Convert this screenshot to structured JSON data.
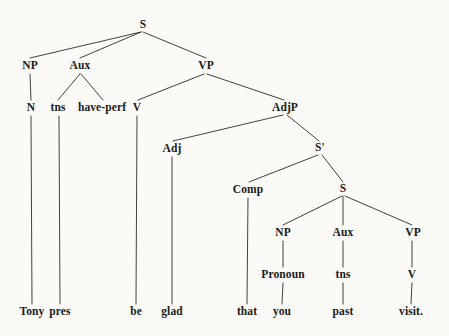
{
  "figure": {
    "kind": "syntax-tree",
    "sentence": "Tony pres be glad that you past visit.",
    "background_color": "#fbfaf7",
    "line_color": "#2b2b2b",
    "text_color": "#1a1a1a"
  },
  "nodes": [
    {
      "id": "s-root",
      "label": "S",
      "x": 143,
      "y": 25
    },
    {
      "id": "np-matrix",
      "label": "NP",
      "x": 30,
      "y": 66
    },
    {
      "id": "aux-matrix",
      "label": "Aux",
      "x": 80,
      "y": 66
    },
    {
      "id": "vp-matrix",
      "label": "VP",
      "x": 206,
      "y": 66
    },
    {
      "id": "n-matrix",
      "label": "N",
      "x": 31,
      "y": 108
    },
    {
      "id": "tns-matrix",
      "label": "tns",
      "x": 58,
      "y": 108
    },
    {
      "id": "have-perf",
      "label": "have-perf",
      "x": 102,
      "y": 108
    },
    {
      "id": "v-matrix",
      "label": "V",
      "x": 137,
      "y": 108
    },
    {
      "id": "adjp",
      "label": "AdjP",
      "x": 285,
      "y": 108
    },
    {
      "id": "adj",
      "label": "Adj",
      "x": 172,
      "y": 149
    },
    {
      "id": "s-bar",
      "label": "S'",
      "x": 320,
      "y": 148
    },
    {
      "id": "comp",
      "label": "Comp",
      "x": 248,
      "y": 190
    },
    {
      "id": "s-embedded",
      "label": "S",
      "x": 343,
      "y": 189
    },
    {
      "id": "np-embedded",
      "label": "NP",
      "x": 283,
      "y": 233
    },
    {
      "id": "aux-embedded",
      "label": "Aux",
      "x": 343,
      "y": 233
    },
    {
      "id": "vp-embedded",
      "label": "VP",
      "x": 413,
      "y": 233
    },
    {
      "id": "pronoun",
      "label": "Pronoun",
      "x": 283,
      "y": 275
    },
    {
      "id": "tns-embedded",
      "label": "tns",
      "x": 343,
      "y": 275
    },
    {
      "id": "v-embedded",
      "label": "V",
      "x": 412,
      "y": 275
    }
  ],
  "terminals": [
    {
      "id": "word-tony",
      "label": "Tony",
      "x": 32,
      "y": 312
    },
    {
      "id": "word-pres",
      "label": "pres",
      "x": 60,
      "y": 312
    },
    {
      "id": "word-be",
      "label": "be",
      "x": 136,
      "y": 312
    },
    {
      "id": "word-glad",
      "label": "glad",
      "x": 172,
      "y": 312
    },
    {
      "id": "word-that",
      "label": "that",
      "x": 247,
      "y": 312
    },
    {
      "id": "word-you",
      "label": "you",
      "x": 282,
      "y": 312
    },
    {
      "id": "word-past",
      "label": "past",
      "x": 343,
      "y": 312
    },
    {
      "id": "word-visit",
      "label": "visit.",
      "x": 411,
      "y": 312
    }
  ],
  "edges": [
    {
      "id": "e-s-np",
      "from": "s-root",
      "to": "np-matrix",
      "x1": 141,
      "y1": 32,
      "x2": 30,
      "y2": 58
    },
    {
      "id": "e-s-aux",
      "from": "s-root",
      "to": "aux-matrix",
      "x1": 141,
      "y1": 32,
      "x2": 80,
      "y2": 58
    },
    {
      "id": "e-s-vp",
      "from": "s-root",
      "to": "vp-matrix",
      "x1": 143,
      "y1": 32,
      "x2": 206,
      "y2": 58
    },
    {
      "id": "e-np-n",
      "from": "np-matrix",
      "to": "n-matrix",
      "x1": 30,
      "y1": 74,
      "x2": 31,
      "y2": 100
    },
    {
      "id": "e-aux-tns",
      "from": "aux-matrix",
      "to": "tns-matrix",
      "x1": 80,
      "y1": 74,
      "x2": 58,
      "y2": 100
    },
    {
      "id": "e-aux-haveperf",
      "from": "aux-matrix",
      "to": "have-perf",
      "x1": 81,
      "y1": 74,
      "x2": 103,
      "y2": 100
    },
    {
      "id": "e-vp-v",
      "from": "vp-matrix",
      "to": "v-matrix",
      "x1": 204,
      "y1": 74,
      "x2": 138,
      "y2": 100
    },
    {
      "id": "e-vp-adjp",
      "from": "vp-matrix",
      "to": "adjp",
      "x1": 207,
      "y1": 74,
      "x2": 284,
      "y2": 100
    },
    {
      "id": "e-adjp-adj",
      "from": "adjp",
      "to": "adj",
      "x1": 283,
      "y1": 115,
      "x2": 173,
      "y2": 141
    },
    {
      "id": "e-adjp-sbar",
      "from": "adjp",
      "to": "s-bar",
      "x1": 287,
      "y1": 115,
      "x2": 319,
      "y2": 141
    },
    {
      "id": "e-sbar-comp",
      "from": "s-bar",
      "to": "comp",
      "x1": 318,
      "y1": 155,
      "x2": 249,
      "y2": 182
    },
    {
      "id": "e-sbar-s",
      "from": "s-bar",
      "to": "s-embedded",
      "x1": 322,
      "y1": 155,
      "x2": 343,
      "y2": 182
    },
    {
      "id": "e-s2-np",
      "from": "s-embedded",
      "to": "np-embedded",
      "x1": 342,
      "y1": 196,
      "x2": 283,
      "y2": 225
    },
    {
      "id": "e-s2-aux",
      "from": "s-embedded",
      "to": "aux-embedded",
      "x1": 343,
      "y1": 196,
      "x2": 343,
      "y2": 225
    },
    {
      "id": "e-s2-vp",
      "from": "s-embedded",
      "to": "vp-embedded",
      "x1": 345,
      "y1": 196,
      "x2": 412,
      "y2": 225
    },
    {
      "id": "e-np2-pronoun",
      "from": "np-embedded",
      "to": "pronoun",
      "x1": 283,
      "y1": 241,
      "x2": 283,
      "y2": 267
    },
    {
      "id": "e-aux2-tns",
      "from": "aux-embedded",
      "to": "tns-embedded",
      "x1": 343,
      "y1": 241,
      "x2": 343,
      "y2": 267
    },
    {
      "id": "e-vp2-v",
      "from": "vp-embedded",
      "to": "v-embedded",
      "x1": 412,
      "y1": 241,
      "x2": 412,
      "y2": 267
    },
    {
      "id": "e-n-tony",
      "from": "n-matrix",
      "to": "word-tony",
      "x1": 31,
      "y1": 116,
      "x2": 32,
      "y2": 304
    },
    {
      "id": "e-tns-pres",
      "from": "tns-matrix",
      "to": "word-pres",
      "x1": 59,
      "y1": 116,
      "x2": 60,
      "y2": 304
    },
    {
      "id": "e-v-be",
      "from": "v-matrix",
      "to": "word-be",
      "x1": 137,
      "y1": 116,
      "x2": 136,
      "y2": 304
    },
    {
      "id": "e-adj-glad",
      "from": "adj",
      "to": "word-glad",
      "x1": 172,
      "y1": 157,
      "x2": 172,
      "y2": 304
    },
    {
      "id": "e-comp-that",
      "from": "comp",
      "to": "word-that",
      "x1": 248,
      "y1": 198,
      "x2": 247,
      "y2": 304
    },
    {
      "id": "e-pronoun-you",
      "from": "pronoun",
      "to": "word-you",
      "x1": 283,
      "y1": 283,
      "x2": 282,
      "y2": 304
    },
    {
      "id": "e-tns2-past",
      "from": "tns-embedded",
      "to": "word-past",
      "x1": 343,
      "y1": 283,
      "x2": 343,
      "y2": 304
    },
    {
      "id": "e-v2-visit",
      "from": "v-embedded",
      "to": "word-visit",
      "x1": 412,
      "y1": 283,
      "x2": 411,
      "y2": 304
    }
  ]
}
